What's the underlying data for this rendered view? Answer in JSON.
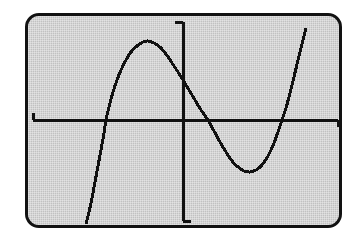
{
  "screen": {
    "device": "graphing-calculator-display",
    "frame": {
      "x": 25,
      "y": 13,
      "width": 317,
      "height": 215,
      "corner_radius": 14,
      "border_width": 3,
      "border_color": "#121212",
      "background_color": "#c9c9c9"
    }
  },
  "chart_data": {
    "type": "line",
    "title": "",
    "subtitle": "",
    "xlabel": "",
    "ylabel": "",
    "grid": false,
    "legend": null,
    "tick_labels": {
      "x": [],
      "y": []
    },
    "axes": {
      "x_axis": {
        "orientation": "horizontal",
        "screen_y": 120,
        "start_x": 33,
        "end_x": 338,
        "stroke_width": 3,
        "color": "#111111",
        "end_caps": [
          {
            "position": "left",
            "direction": "up",
            "length": 7
          },
          {
            "position": "right",
            "direction": "down",
            "length": 7
          }
        ]
      },
      "y_axis": {
        "orientation": "vertical",
        "screen_x": 183,
        "start_y": 22,
        "end_y": 221,
        "stroke_width": 3,
        "color": "#111111",
        "end_caps": [
          {
            "position": "top",
            "direction": "left",
            "length": 8
          },
          {
            "position": "bottom",
            "direction": "right",
            "length": 8
          }
        ]
      },
      "origin": {
        "x": 183,
        "y": 120
      }
    },
    "series": [
      {
        "name": "cubic-curve",
        "color": "#111111",
        "stroke_width": 3,
        "shape": "cubic",
        "x_intercepts": [
          106,
          208,
          282
        ],
        "local_maximum": {
          "x": 148,
          "y": 42
        },
        "local_minimum": {
          "x": 250,
          "y": 172
        },
        "y_intercept": {
          "x": 183,
          "y": 80
        },
        "points": [
          [
            86,
            224
          ],
          [
            89,
            212
          ],
          [
            92,
            198
          ],
          [
            95,
            182
          ],
          [
            98,
            166
          ],
          [
            101,
            150
          ],
          [
            104,
            133
          ],
          [
            106,
            120
          ],
          [
            109,
            107
          ],
          [
            113,
            92
          ],
          [
            117,
            80
          ],
          [
            121,
            70
          ],
          [
            126,
            60
          ],
          [
            131,
            52
          ],
          [
            137,
            46
          ],
          [
            143,
            42
          ],
          [
            148,
            41
          ],
          [
            154,
            43
          ],
          [
            160,
            47
          ],
          [
            166,
            54
          ],
          [
            172,
            63
          ],
          [
            178,
            72
          ],
          [
            183,
            80
          ],
          [
            189,
            90
          ],
          [
            195,
            100
          ],
          [
            201,
            110
          ],
          [
            208,
            120
          ],
          [
            214,
            131
          ],
          [
            220,
            142
          ],
          [
            226,
            152
          ],
          [
            232,
            161
          ],
          [
            238,
            167
          ],
          [
            244,
            171
          ],
          [
            250,
            172
          ],
          [
            256,
            170
          ],
          [
            262,
            165
          ],
          [
            268,
            156
          ],
          [
            274,
            143
          ],
          [
            279,
            129
          ],
          [
            282,
            120
          ],
          [
            286,
            108
          ],
          [
            290,
            93
          ],
          [
            294,
            77
          ],
          [
            298,
            60
          ],
          [
            302,
            44
          ],
          [
            306,
            28
          ]
        ]
      }
    ]
  }
}
